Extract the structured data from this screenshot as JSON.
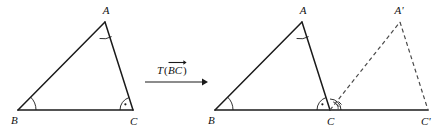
{
  "figure": {
    "kind": "geometry-diagram",
    "background_color": "#ffffff",
    "line_color": "#1a1a1a",
    "dashed_color": "#4a4a4a"
  },
  "left_figure": {
    "name": "original-triangle",
    "vertices": {
      "B": {
        "label": "B",
        "x": 18,
        "y": 110
      },
      "C": {
        "label": "C",
        "x": 133,
        "y": 110
      },
      "A": {
        "label": "A",
        "x": 105,
        "y": 22
      }
    },
    "vertex_labels": {
      "B": {
        "text": "B",
        "x": 11,
        "y": 124
      },
      "C": {
        "text": "C",
        "x": 130,
        "y": 125
      },
      "A": {
        "text": "A",
        "x": 106,
        "y": 14
      }
    },
    "angle_marks": [
      {
        "name": "angle-B",
        "vertex": "B",
        "style": "arc"
      },
      {
        "name": "angle-A",
        "vertex": "A",
        "style": "arc"
      },
      {
        "name": "angle-C",
        "vertex": "C",
        "style": "arc-with-dot"
      }
    ]
  },
  "arrow": {
    "name": "transformation-arrow",
    "label_T": "T",
    "label_open_paren": "(",
    "label_vector": "BC",
    "label_close_paren": ")",
    "label_full": "T(BC)",
    "vector_overbar": true,
    "x_start": 145,
    "x_end": 205,
    "y": 82
  },
  "right_figure": {
    "name": "translated-triangle",
    "vertices": {
      "B": {
        "label": "B",
        "x": 215,
        "y": 110
      },
      "C": {
        "label": "C",
        "x": 330,
        "y": 110
      },
      "A": {
        "label": "A",
        "x": 302,
        "y": 22
      },
      "C_prime": {
        "label": "C'",
        "x": 428,
        "y": 110
      },
      "A_prime": {
        "label": "A'",
        "x": 400,
        "y": 22
      }
    },
    "vertex_labels": {
      "B": {
        "text": "B",
        "x": 208,
        "y": 124
      },
      "C": {
        "text": "C",
        "x": 327,
        "y": 125
      },
      "A": {
        "text": "A",
        "x": 303,
        "y": 14
      },
      "C_prime": {
        "text": "C'",
        "x": 423,
        "y": 125
      },
      "A_prime": {
        "text": "A'",
        "x": 399,
        "y": 14
      }
    },
    "angle_marks": [
      {
        "name": "angle-B",
        "vertex": "B",
        "style": "arc"
      },
      {
        "name": "angle-A",
        "vertex": "A",
        "style": "arc"
      },
      {
        "name": "angle-C",
        "vertex": "C",
        "style": "arc-with-dot"
      },
      {
        "name": "angle-C-prime-image",
        "vertex": "C",
        "style": "arc-hatched-dashed"
      }
    ],
    "dashed_edges": [
      {
        "name": "edge-C-to-A-prime",
        "from": "C",
        "to": "A_prime"
      },
      {
        "name": "edge-A-prime-to-C-prime",
        "from": "A_prime",
        "to": "C_prime"
      }
    ]
  }
}
